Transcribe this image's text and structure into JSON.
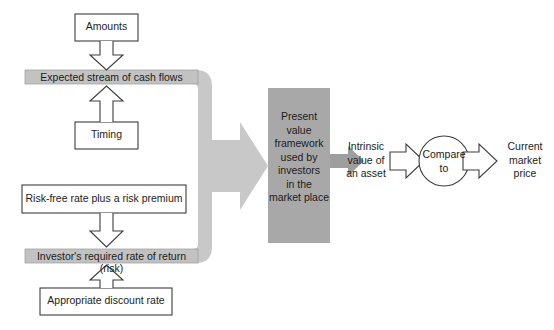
{
  "diagram": {
    "title": "Present value framework used by investors in the market place",
    "colors": {
      "bracket_gray": "#c8c8c8",
      "bar_gray": "#c2c2c2",
      "center_box_gray": "#a8a8a8",
      "outline": "#3c3c3c",
      "box_fill": "#ffffff",
      "text": "#1c1c1c"
    },
    "left_inputs": [
      {
        "id": "amounts",
        "label": "Amounts"
      },
      {
        "id": "timing",
        "label": "Timing"
      },
      {
        "id": "risk-free-rate",
        "label": "Risk-free rate plus a risk premium"
      },
      {
        "id": "appropriate-discount-rate",
        "label": "Appropriate discount rate"
      }
    ],
    "gray_bars": [
      {
        "id": "expected-cash-flows",
        "label": "Expected stream of cash flows"
      },
      {
        "id": "required-rate-of-return",
        "label": "Investor's required rate of return (risk)"
      }
    ],
    "center_box": {
      "id": "present-value-framework",
      "lines": [
        "Present",
        "value",
        "framework",
        "used by",
        "investors",
        "in the",
        "market place"
      ]
    },
    "outputs": {
      "intrinsic_value": {
        "id": "intrinsic-value",
        "lines": [
          "Intrinsic",
          "value of",
          "an asset"
        ]
      },
      "compare_node": {
        "id": "compare-to",
        "lines": [
          "Compare",
          "to"
        ]
      },
      "current_price": {
        "id": "current-market-price",
        "lines": [
          "Current",
          "market",
          "price"
        ]
      }
    },
    "arrows": [
      {
        "id": "amounts-to-cashflows",
        "direction": "down",
        "style": "outline"
      },
      {
        "id": "timing-to-cashflows",
        "direction": "up",
        "style": "outline"
      },
      {
        "id": "riskfree-to-required",
        "direction": "down",
        "style": "outline"
      },
      {
        "id": "discount-to-required",
        "direction": "up",
        "style": "outline"
      },
      {
        "id": "bracket-to-framework",
        "direction": "right",
        "style": "solid-gray"
      },
      {
        "id": "framework-to-intrinsic",
        "direction": "right",
        "style": "solid-gray"
      },
      {
        "id": "intrinsic-to-compare",
        "direction": "right",
        "style": "outline"
      },
      {
        "id": "compare-to-price",
        "direction": "right",
        "style": "outline"
      }
    ]
  }
}
